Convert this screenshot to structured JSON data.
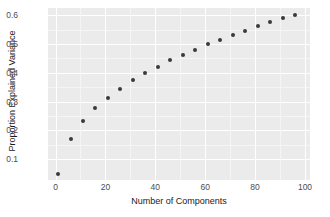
{
  "chart_data": {
    "type": "scatter",
    "title": "",
    "xlabel": "Number of Components",
    "ylabel": "Proportion Explained Variance",
    "xlim": [
      -3,
      102
    ],
    "ylim": [
      0.028,
      0.625
    ],
    "xticks": [
      0,
      20,
      40,
      60,
      80,
      100
    ],
    "xtick_labels": [
      "0",
      "20",
      "40",
      "60",
      "80",
      "100"
    ],
    "yticks": [
      0.1,
      0.2,
      0.3,
      0.4,
      0.5,
      0.6
    ],
    "ytick_labels": [
      "0.1",
      "0.2",
      "0.3",
      "0.4",
      "0.5",
      "0.6"
    ],
    "grid": true,
    "legend": "none",
    "panel_background": "#ebebeb",
    "gridline_color": "#ffffff",
    "point_color": "#3a3a3a",
    "point_size": 4,
    "x": [
      1,
      6,
      11,
      16,
      21,
      26,
      31,
      36,
      41,
      46,
      51,
      56,
      61,
      66,
      71,
      76,
      81,
      86,
      91,
      96
    ],
    "y": [
      0.048,
      0.172,
      0.234,
      0.277,
      0.314,
      0.345,
      0.375,
      0.4,
      0.421,
      0.443,
      0.462,
      0.481,
      0.499,
      0.515,
      0.532,
      0.547,
      0.561,
      0.575,
      0.589,
      0.601
    ],
    "series": [
      {
        "name": "Cumulative proportion of explained variance",
        "x": [
          1,
          6,
          11,
          16,
          21,
          26,
          31,
          36,
          41,
          46,
          51,
          56,
          61,
          66,
          71,
          76,
          81,
          86,
          91,
          96
        ],
        "values": [
          0.048,
          0.172,
          0.234,
          0.277,
          0.314,
          0.345,
          0.375,
          0.4,
          0.421,
          0.443,
          0.462,
          0.481,
          0.499,
          0.515,
          0.532,
          0.547,
          0.561,
          0.575,
          0.589,
          0.601
        ]
      }
    ]
  }
}
